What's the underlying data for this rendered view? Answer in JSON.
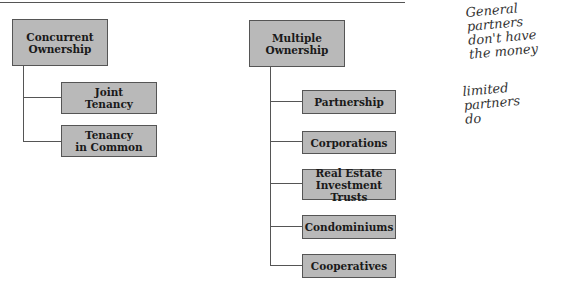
{
  "groups": [
    {
      "title": "Concurrent\nOwnership",
      "children": [
        "Joint\nTenancy",
        "Tenancy\nin Common"
      ]
    },
    {
      "title": "Multiple\nOwnership",
      "children": [
        "Partnership",
        "Corporations",
        "Real Estate\nInvestment Trusts",
        "Condominiums",
        "Cooperatives"
      ]
    }
  ],
  "annotations": [
    "General partners\ndon't have\n the money",
    "limited partners\n do"
  ]
}
